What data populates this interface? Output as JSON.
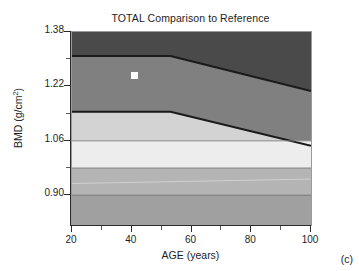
{
  "figure": {
    "panel_label": "(c)",
    "background_color": "#ffffff"
  },
  "chart_data": {
    "type": "area",
    "title": "TOTAL Comparison to Reference",
    "xlabel": "AGE (years)",
    "ylabel": "BMD (g/cm2)",
    "ylabel_base": "BMD (g/cm",
    "ylabel_exponent": "2",
    "ylabel_close": ")",
    "xlim": [
      20,
      100
    ],
    "ylim": [
      0.8125,
      1.38
    ],
    "grid": false,
    "legend": false,
    "xticks": [
      20,
      40,
      60,
      80,
      100
    ],
    "xtick_labels": [
      "20",
      "40",
      "60",
      "80",
      "100"
    ],
    "xticks_minor": [
      30,
      50,
      70,
      90
    ],
    "yticks": [
      1.38,
      1.22,
      1.06,
      0.9
    ],
    "ytick_labels": [
      "1.38",
      "1.22",
      "1.06",
      "0.90"
    ],
    "yticks_minor": [
      1.3,
      1.14,
      0.98
    ],
    "bands": [
      {
        "name": "above-plus-2sd",
        "color": "#4a4a4a",
        "upper": [
          [
            20,
            1.38
          ],
          [
            100,
            1.38
          ]
        ],
        "lower": [
          [
            20,
            1.3095
          ],
          [
            53,
            1.3095
          ],
          [
            100,
            1.2065
          ]
        ]
      },
      {
        "name": "plus-1sd-to-plus-2sd",
        "color": "#808080",
        "upper": [
          [
            20,
            1.3095
          ],
          [
            53,
            1.3095
          ],
          [
            100,
            1.2065
          ]
        ],
        "lower": [
          [
            20,
            1.1455
          ],
          [
            53,
            1.1455
          ],
          [
            100,
            1.0455
          ]
        ]
      },
      {
        "name": "mean-to-plus-1sd",
        "color": "#d3d3d3",
        "upper": [
          [
            20,
            1.1455
          ],
          [
            53,
            1.1455
          ],
          [
            100,
            1.0455
          ]
        ],
        "lower": [
          [
            20,
            1.06
          ],
          [
            100,
            1.06
          ]
        ]
      },
      {
        "name": "mean-band-light",
        "color": "#ededed",
        "upper": [
          [
            20,
            1.06
          ],
          [
            100,
            1.06
          ]
        ],
        "lower": [
          [
            20,
            0.98
          ],
          [
            100,
            0.98
          ]
        ]
      },
      {
        "name": "minus-1sd-band",
        "color": "#b4b4b4",
        "upper": [
          [
            20,
            0.98
          ],
          [
            100,
            0.98
          ]
        ],
        "lower": [
          [
            20,
            0.9
          ],
          [
            100,
            0.9
          ]
        ]
      },
      {
        "name": "below-minus-1sd",
        "color": "#a0a0a0",
        "upper": [
          [
            20,
            0.9
          ],
          [
            100,
            0.9
          ]
        ],
        "lower": [
          [
            20,
            0.8125
          ],
          [
            100,
            0.8125
          ]
        ]
      }
    ],
    "boundary_lines": [
      {
        "name": "upper-dark-boundary",
        "color": "#1a1a1a",
        "width": 2.2,
        "points": [
          [
            20,
            1.3095
          ],
          [
            53,
            1.3095
          ],
          [
            100,
            1.2065
          ]
        ]
      },
      {
        "name": "lower-dark-boundary",
        "color": "#1a1a1a",
        "width": 2.2,
        "points": [
          [
            20,
            1.1455
          ],
          [
            53,
            1.1455
          ],
          [
            100,
            1.0455
          ]
        ]
      },
      {
        "name": "mean-line",
        "color": "#7d7d7d",
        "width": 0.9,
        "points": [
          [
            20,
            1.06
          ],
          [
            100,
            1.06
          ]
        ]
      },
      {
        "name": "minus-1sd-line",
        "color": "#7d7d7d",
        "width": 0.9,
        "points": [
          [
            20,
            0.98
          ],
          [
            100,
            0.98
          ]
        ]
      },
      {
        "name": "minus-2sd-line",
        "color": "#6e6e6e",
        "width": 0.9,
        "points": [
          [
            20,
            0.9
          ],
          [
            100,
            0.9
          ]
        ]
      },
      {
        "name": "faint-light-line",
        "color": "#d2d2d2",
        "width": 0.9,
        "points": [
          [
            20,
            0.9345
          ],
          [
            100,
            0.9475
          ]
        ]
      }
    ],
    "points": [
      {
        "name": "patient-measurement",
        "marker": "square",
        "color": "#ffffff",
        "x": 41,
        "y": 1.251
      }
    ]
  }
}
